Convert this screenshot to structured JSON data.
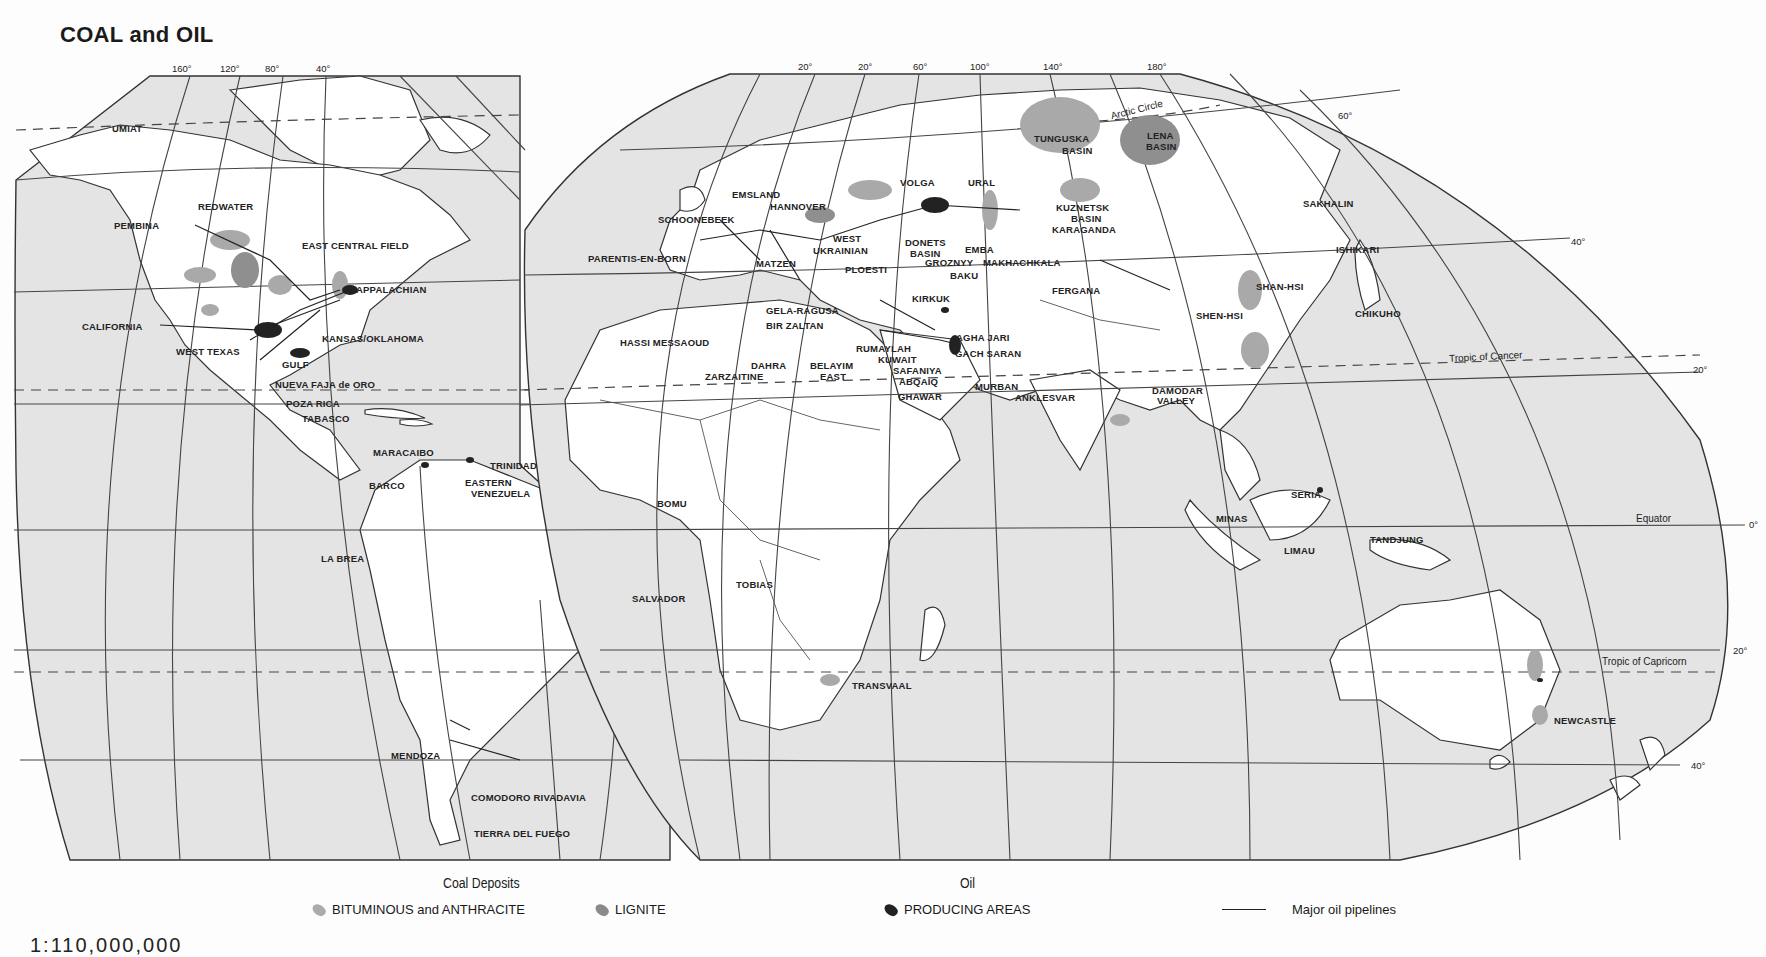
{
  "title": "COAL and OIL",
  "scale_text": "1:110,000,000",
  "colors": {
    "ocean": "#e4e4e4",
    "land": "#ffffff",
    "bituminous_anthracite": "#a9a9a9",
    "lignite": "#8f8f8f",
    "oil_producing": "#222222",
    "background": "#fdfdfd"
  },
  "longitude_labels": {
    "americas": [
      "160°",
      "120°",
      "80°",
      "40°"
    ],
    "eurasia": [
      "20°",
      "20°",
      "60°",
      "100°",
      "140°",
      "180°"
    ]
  },
  "latitude_labels": [
    "60°",
    "40°",
    "20°",
    "0°",
    "20°",
    "40°"
  ],
  "geo_lines": {
    "arctic_circle": "Arctic Circle",
    "tropic_cancer": "Tropic of Cancer",
    "equator": "Equator",
    "tropic_capricorn": "Tropic of Capricorn"
  },
  "places": {
    "north_america": [
      "UMIAT",
      "REDWATER",
      "PEMBINA",
      "EAST CENTRAL FIELD",
      "APPALACHIAN",
      "CALIFORNIA",
      "KANSAS/OKLAHOMA",
      "WEST TEXAS",
      "GULF",
      "NUEVA FAJA de ORO",
      "POZA RICA",
      "TABASCO"
    ],
    "south_america": [
      "MARACAIBO",
      "BARCO",
      "TRINIDAD",
      "EASTERN",
      "VENEZUELA",
      "LA BREA",
      "SALVADOR",
      "MENDOZA",
      "COMODORO RIVADAVIA",
      "TIERRA DEL FUEGO"
    ],
    "europe": [
      "EMSLAND",
      "HANNOVER",
      "SCHOONEBEEK",
      "PARENTIS-EN-BORN",
      "WEST",
      "UKRAINIAN",
      "MATZEN",
      "PLOESTI",
      "VOLGA",
      "URAL",
      "DONETS",
      "BASIN",
      "EMBA",
      "GROZNYY",
      "MAKHACHKALA",
      "BAKU"
    ],
    "africa_mideast": [
      "GELA-RAGUSA",
      "BIR ZALTAN",
      "HASSI MESSAOUD",
      "DAHRA",
      "ZARZAITINE",
      "BELAYIM",
      "EAST",
      "KIRKUK",
      "RUMAYLAH",
      "KUWAIT",
      "SAFANIYA",
      "ABQAIQ",
      "GHAWAR",
      "AGHA JARI",
      "GACH SARAN",
      "MURBAN",
      "BOMU",
      "TOBIAS",
      "TRANSVAAL"
    ],
    "asia": [
      "TUNGUSKA",
      "BASIN",
      "LENA",
      "BASIN",
      "KUZNETSK",
      "BASIN",
      "KARAGANDA",
      "FERGANA",
      "ANKLESVAR",
      "DAMODAR",
      "VALLEY",
      "SAKHALIN",
      "ISHIKARI",
      "SHAN-HSI",
      "SHEN-HSI",
      "CHIKUHO",
      "SERIA",
      "MINAS",
      "LIMAU",
      "TANDJUNG",
      "NEWCASTLE"
    ]
  },
  "legend": {
    "coal_heading": "Coal Deposits",
    "coal_items": [
      "BITUMINOUS and ANTHRACITE",
      "LIGNITE"
    ],
    "oil_heading": "Oil",
    "oil_items": [
      "PRODUCING AREAS"
    ],
    "pipeline_label": "Major oil pipelines"
  }
}
